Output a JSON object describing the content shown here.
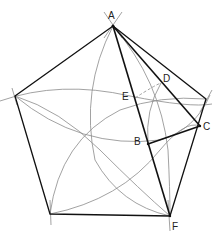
{
  "diagram": {
    "points": {
      "A": {
        "label": "A",
        "x": 113,
        "y": 26
      },
      "R": {
        "label": "",
        "x": 206,
        "y": 99
      },
      "F": {
        "label": "F",
        "x": 170,
        "y": 216
      },
      "G": {
        "label": "",
        "x": 50,
        "y": 214
      },
      "L": {
        "label": "",
        "x": 15,
        "y": 96
      },
      "B": {
        "label": "B",
        "x": 148,
        "y": 144
      },
      "C": {
        "label": "C",
        "x": 200,
        "y": 126
      },
      "D": {
        "label": "D",
        "x": 161,
        "y": 83
      },
      "E": {
        "label": "E",
        "x": 135,
        "y": 98
      }
    },
    "labels": {
      "A": "A",
      "B": "B",
      "C": "C",
      "D": "D",
      "E": "E",
      "F": "F"
    },
    "colors": {
      "stroke_main": "#111111",
      "stroke_arc": "#888888"
    }
  }
}
